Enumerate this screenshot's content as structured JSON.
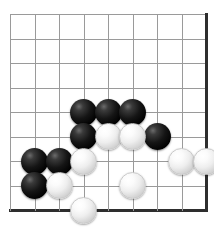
{
  "board": {
    "title": "Go board position",
    "type": "go-board",
    "columns": 9,
    "rows": 9,
    "origin_x": 10,
    "origin_y": 14,
    "spacing": 24.5,
    "stone_radius": 13.5,
    "grid_color": "#9a9a9a",
    "edge_color": "#2e2e2e",
    "background_color": "#ffffff",
    "edges": {
      "right": true,
      "bottom": true,
      "top": false,
      "left": false
    },
    "stones": [
      {
        "color": "black",
        "col": 3,
        "row": 4
      },
      {
        "color": "black",
        "col": 4,
        "row": 4
      },
      {
        "color": "black",
        "col": 5,
        "row": 4
      },
      {
        "color": "black",
        "col": 3,
        "row": 5
      },
      {
        "color": "black",
        "col": 6,
        "row": 5
      },
      {
        "color": "black",
        "col": 1,
        "row": 6
      },
      {
        "color": "black",
        "col": 2,
        "row": 6
      },
      {
        "color": "black",
        "col": 1,
        "row": 7
      },
      {
        "color": "white",
        "col": 4,
        "row": 5
      },
      {
        "color": "white",
        "col": 5,
        "row": 5
      },
      {
        "color": "white",
        "col": 3,
        "row": 6
      },
      {
        "color": "white",
        "col": 7,
        "row": 6
      },
      {
        "color": "white",
        "col": 8,
        "row": 6
      },
      {
        "color": "white",
        "col": 2,
        "row": 7
      },
      {
        "color": "white",
        "col": 5,
        "row": 7
      },
      {
        "color": "white",
        "col": 3,
        "row": 8
      }
    ],
    "stone_counts": {
      "black": 8,
      "white": 8
    }
  }
}
